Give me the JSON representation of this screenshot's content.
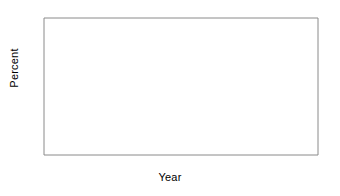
{
  "chart_data": {
    "type": "line",
    "title": "",
    "xlabel": "Year",
    "ylabel": "Percent",
    "xlim": [
      64,
      95
    ],
    "ylim": [
      0,
      70
    ],
    "ytick_labels": [
      "70",
      "60",
      "50",
      "40",
      "30",
      "20",
      "10",
      "0"
    ],
    "ytick_values": [
      70,
      60,
      50,
      40,
      30,
      20,
      10,
      0
    ],
    "xtick_labels": [
      "65",
      "70",
      "75",
      "80",
      "85",
      "90",
      "95"
    ],
    "xtick_values": [
      65,
      70,
      75,
      80,
      85,
      90,
      95
    ],
    "minor_xticks_every": 1,
    "grid": false,
    "legend_position": "inline-annotation",
    "line_color": "#3a3a3a",
    "x": [
      64,
      65,
      66,
      67,
      68,
      69,
      70,
      71,
      72,
      73,
      74,
      75,
      76,
      77,
      78,
      79,
      80,
      81,
      82,
      83,
      84,
      85,
      86,
      87,
      88,
      89,
      90,
      91,
      92,
      93,
      94,
      95
    ],
    "series": [
      {
        "name": "In-hospital",
        "values": [
          28,
          27.8,
          27.4,
          27.2,
          28.6,
          27.8,
          26.8,
          24.6,
          26.6,
          28.2,
          29.4,
          33.5,
          39.5,
          42.5,
          46,
          48.5,
          52.5,
          55.5,
          56.5,
          61.5,
          57,
          58,
          59,
          57.5,
          56,
          54,
          52,
          51,
          52.5,
          54,
          56,
          58
        ]
      },
      {
        "name": "Six months",
        "values": [
          null,
          null,
          null,
          null,
          null,
          null,
          null,
          5,
          5.2,
          7,
          6.5,
          15.5,
          17.5,
          20.5,
          18.5,
          19.5,
          21.5,
          23,
          24.5,
          26.5,
          23,
          23.5,
          21.5,
          21.5,
          20.5,
          19.5,
          17.5,
          18,
          18.2,
          18.5,
          18.8,
          19
        ]
      }
    ],
    "annotations": [
      {
        "text": "In-hospital",
        "x": 66,
        "y": 31.5
      },
      {
        "text": "Six months",
        "x": 66,
        "y": 6.5
      }
    ]
  }
}
